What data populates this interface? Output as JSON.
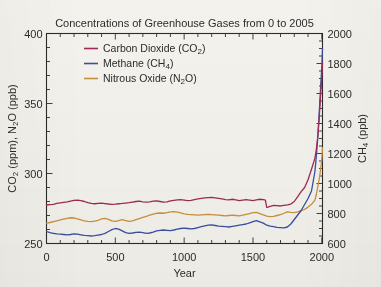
{
  "chart_data": {
    "type": "line",
    "title": "Concentrations of Greenhouse Gases from 0 to 2005",
    "xlabel": "Year",
    "ylabel_left": "CO2 (ppm), N2O (ppb)",
    "ylabel_right": "CH4 (ppb)",
    "xlim": [
      0,
      2005
    ],
    "ylim_left": [
      250,
      400
    ],
    "ylim_right": [
      600,
      2000
    ],
    "xticks": [
      0,
      500,
      1000,
      1500,
      2000
    ],
    "yticks_left": [
      250,
      300,
      350,
      400
    ],
    "yticks_right": [
      600,
      800,
      1000,
      1200,
      1400,
      1600,
      1800,
      2000
    ],
    "xticklabels": [
      "0",
      "500",
      "1000",
      "1500",
      "2000"
    ],
    "yticklabels_left": [
      "250",
      "300",
      "350",
      "400"
    ],
    "yticklabels_right": [
      "600",
      "800",
      "1000",
      "1200",
      "1400",
      "1600",
      "1800",
      "2000"
    ],
    "minor_tick_interval_x": 100,
    "grid": false,
    "legend_position": "upper left inside",
    "series": [
      {
        "name": "Carbon Dioxide (CO2)",
        "legend_label_main": "Carbon Dioxide (CO",
        "legend_sub": "2",
        "legend_label_tail": ")",
        "axis": "left",
        "units": "ppm",
        "color": "#9e2b52",
        "x": [
          0,
          25,
          50,
          75,
          100,
          125,
          150,
          175,
          200,
          225,
          250,
          275,
          300,
          325,
          350,
          375,
          400,
          425,
          450,
          475,
          500,
          525,
          550,
          575,
          600,
          625,
          650,
          675,
          700,
          725,
          750,
          775,
          800,
          825,
          850,
          875,
          900,
          925,
          950,
          975,
          1000,
          1025,
          1050,
          1075,
          1100,
          1125,
          1150,
          1175,
          1200,
          1225,
          1250,
          1275,
          1300,
          1325,
          1350,
          1375,
          1400,
          1425,
          1450,
          1475,
          1500,
          1525,
          1550,
          1575,
          1590,
          1600,
          1610,
          1625,
          1650,
          1675,
          1700,
          1725,
          1750,
          1775,
          1800,
          1825,
          1850,
          1875,
          1900,
          1925,
          1950,
          1960,
          1970,
          1980,
          1990,
          2000,
          2005
        ],
        "y": [
          277.5,
          277.8,
          278.0,
          278.6,
          279.0,
          279.4,
          279.8,
          280.3,
          280.8,
          281.0,
          280.6,
          280.0,
          279.2,
          278.6,
          278.4,
          278.6,
          278.8,
          278.5,
          278.2,
          278.0,
          278.1,
          278.4,
          278.6,
          278.9,
          279.2,
          279.6,
          280.0,
          280.2,
          279.8,
          279.5,
          279.8,
          280.2,
          280.4,
          280.0,
          279.6,
          279.8,
          280.4,
          280.8,
          281.2,
          281.4,
          281.0,
          280.6,
          280.8,
          281.4,
          281.8,
          282.2,
          282.6,
          282.8,
          282.9,
          282.6,
          282.2,
          281.8,
          281.4,
          281.2,
          281.6,
          281.2,
          280.6,
          281.0,
          281.4,
          281.0,
          280.6,
          281.2,
          281.6,
          281.4,
          281.0,
          275.8,
          276.0,
          276.6,
          277.2,
          277.0,
          276.8,
          277.2,
          277.6,
          278.2,
          280.0,
          283.5,
          287.0,
          290.0,
          295.5,
          303.0,
          311.0,
          317.0,
          325.5,
          338.0,
          354.0,
          369.5,
          379.0
        ]
      },
      {
        "name": "Methane (CH4)",
        "legend_label_main": "Methane (CH",
        "legend_sub": "4",
        "legend_label_tail": ")",
        "axis": "right",
        "units": "ppb",
        "color": "#3b4ea0",
        "x": [
          0,
          25,
          50,
          75,
          100,
          125,
          150,
          175,
          200,
          225,
          250,
          275,
          300,
          325,
          350,
          375,
          400,
          425,
          450,
          475,
          500,
          525,
          550,
          575,
          600,
          625,
          650,
          675,
          700,
          725,
          750,
          775,
          800,
          825,
          850,
          875,
          900,
          925,
          950,
          975,
          1000,
          1025,
          1050,
          1075,
          1100,
          1125,
          1150,
          1175,
          1200,
          1225,
          1250,
          1275,
          1300,
          1325,
          1350,
          1375,
          1400,
          1425,
          1450,
          1475,
          1500,
          1525,
          1550,
          1575,
          1600,
          1625,
          1650,
          1675,
          1700,
          1725,
          1750,
          1775,
          1800,
          1825,
          1850,
          1875,
          1900,
          1925,
          1950,
          1960,
          1970,
          1980,
          1990,
          2000,
          2005
        ],
        "y": [
          680,
          672,
          668,
          664,
          662,
          660,
          658,
          660,
          664,
          662,
          658,
          654,
          652,
          650,
          652,
          656,
          660,
          668,
          680,
          692,
          700,
          696,
          684,
          672,
          668,
          670,
          674,
          676,
          672,
          668,
          670,
          676,
          684,
          688,
          690,
          688,
          686,
          690,
          696,
          700,
          702,
          700,
          698,
          700,
          706,
          712,
          718,
          722,
          724,
          720,
          716,
          714,
          712,
          710,
          714,
          718,
          722,
          726,
          730,
          738,
          746,
          752,
          744,
          736,
          722,
          716,
          712,
          708,
          706,
          704,
          710,
          730,
          760,
          790,
          820,
          860,
          900,
          950,
          1080,
          1180,
          1300,
          1450,
          1620,
          1780,
          1900
        ]
      },
      {
        "name": "Nitrous Oxide (N2O)",
        "legend_label_main": "Nitrous Oxide (N",
        "legend_sub": "2",
        "legend_label_tail": "O)",
        "axis": "left",
        "units": "ppb",
        "color": "#c8923c",
        "x": [
          0,
          25,
          50,
          75,
          100,
          125,
          150,
          175,
          200,
          225,
          250,
          275,
          300,
          325,
          350,
          375,
          400,
          425,
          450,
          475,
          500,
          525,
          550,
          575,
          600,
          625,
          650,
          675,
          700,
          725,
          750,
          775,
          800,
          825,
          850,
          875,
          900,
          925,
          950,
          975,
          1000,
          1025,
          1050,
          1075,
          1100,
          1125,
          1150,
          1175,
          1200,
          1225,
          1250,
          1275,
          1300,
          1325,
          1350,
          1375,
          1400,
          1425,
          1450,
          1475,
          1500,
          1525,
          1550,
          1575,
          1600,
          1625,
          1650,
          1675,
          1700,
          1725,
          1750,
          1775,
          1800,
          1825,
          1850,
          1875,
          1900,
          1925,
          1950,
          1960,
          1970,
          1980,
          1990,
          2000,
          2005
        ],
        "y": [
          264.5,
          265.0,
          265.6,
          266.2,
          266.8,
          267.4,
          268.0,
          268.4,
          268.2,
          267.6,
          266.8,
          266.2,
          265.8,
          265.6,
          266.0,
          266.6,
          267.6,
          268.0,
          267.2,
          266.2,
          265.8,
          266.4,
          267.0,
          266.4,
          265.8,
          266.2,
          267.0,
          267.8,
          268.6,
          269.4,
          270.2,
          271.0,
          271.6,
          271.8,
          271.6,
          272.0,
          272.6,
          272.8,
          272.4,
          271.8,
          271.2,
          270.8,
          270.6,
          270.4,
          270.2,
          270.4,
          270.6,
          270.8,
          270.6,
          270.4,
          270.2,
          270.0,
          269.8,
          270.0,
          270.2,
          270.0,
          269.8,
          270.2,
          270.8,
          271.4,
          272.0,
          272.2,
          271.4,
          270.4,
          269.6,
          269.2,
          269.4,
          270.0,
          270.6,
          271.6,
          272.6,
          272.2,
          272.0,
          272.6,
          273.4,
          274.4,
          276.0,
          278.0,
          281.0,
          285.0,
          290.0,
          295.5,
          302.0,
          310.0,
          318.5
        ]
      }
    ]
  }
}
